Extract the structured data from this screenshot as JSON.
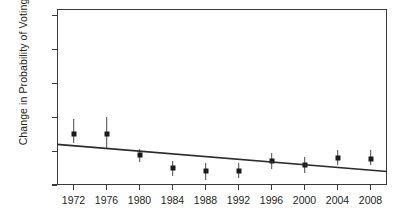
{
  "chart_data": {
    "type": "scatter",
    "title": "",
    "xlabel": "",
    "ylabel": "Change in Probability of Voting",
    "categories": [
      "1972",
      "1976",
      "1980",
      "1984",
      "1988",
      "1992",
      "1996",
      "2000",
      "2004",
      "2008"
    ],
    "x": [
      1972,
      1976,
      1980,
      1984,
      1988,
      1992,
      1996,
      2000,
      2004,
      2008
    ],
    "values": [
      0.176,
      0.176,
      0.145,
      0.125,
      0.12,
      0.121,
      0.135,
      0.13,
      0.14,
      0.139
    ],
    "error_low": [
      0.162,
      0.155,
      0.134,
      0.114,
      0.108,
      0.111,
      0.124,
      0.118,
      0.13,
      0.129
    ],
    "error_high": [
      0.198,
      0.2,
      0.153,
      0.136,
      0.132,
      0.133,
      0.148,
      0.142,
      0.152,
      0.151
    ],
    "ylim": [
      0.1,
      0.36
    ],
    "xlim": [
      1970,
      2010
    ],
    "yticks": [
      0.1,
      0.15,
      0.2,
      0.25,
      0.3,
      0.35
    ],
    "ytick_labels": [
      "0.10",
      "0.15",
      "0.20",
      "0.25",
      "0.30",
      "0.35"
    ],
    "grid": false,
    "legend": "none",
    "trendline": {
      "name": "fitted trend",
      "x_start": 1970,
      "y_start": 0.16,
      "x_end": 2010,
      "y_end": 0.12
    },
    "marker_color": "#1a1a1a",
    "errorbar_color": "#4a4a4a",
    "axis_color": "#3b3b3b",
    "background": "#ffffff"
  }
}
